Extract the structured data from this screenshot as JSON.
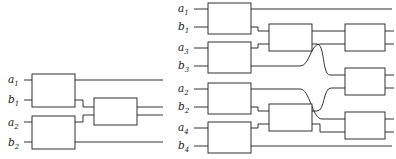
{
  "figure": {
    "title": "",
    "background_color": "#ffffff",
    "line_color": "#1b1b1b",
    "panels": [
      {
        "id": "left-network",
        "name": "left-circuit-diagram",
        "input_labels": [
          "a₁",
          "b₁",
          "a₂",
          "b₂"
        ],
        "label_parts": [
          {
            "base": "a",
            "sub": "1"
          },
          {
            "base": "b",
            "sub": "1"
          },
          {
            "base": "a",
            "sub": "2"
          },
          {
            "base": "b",
            "sub": "2"
          }
        ],
        "gate_count": 3,
        "gates": [
          {
            "name": "gate-l1",
            "column": 1,
            "wires": [
              "a1",
              "b1"
            ]
          },
          {
            "name": "gate-l2",
            "column": 1,
            "wires": [
              "a2",
              "b2"
            ]
          },
          {
            "name": "gate-l3",
            "column": 2,
            "wires": [
              "b1",
              "a2"
            ]
          }
        ]
      },
      {
        "id": "right-network",
        "name": "right-circuit-diagram",
        "input_labels": [
          "a₁",
          "b₁",
          "a₃",
          "b₃",
          "a₂",
          "b₂",
          "a₄",
          "b₄"
        ],
        "label_parts": [
          {
            "base": "a",
            "sub": "1"
          },
          {
            "base": "b",
            "sub": "1"
          },
          {
            "base": "a",
            "sub": "3"
          },
          {
            "base": "b",
            "sub": "3"
          },
          {
            "base": "a",
            "sub": "2"
          },
          {
            "base": "b",
            "sub": "2"
          },
          {
            "base": "a",
            "sub": "4"
          },
          {
            "base": "b",
            "sub": "4"
          }
        ],
        "gate_count": 9,
        "gates": [
          {
            "name": "gate-r1",
            "column": 1,
            "wires": [
              "a1",
              "b1"
            ]
          },
          {
            "name": "gate-r2",
            "column": 1,
            "wires": [
              "a3",
              "b3"
            ]
          },
          {
            "name": "gate-r3",
            "column": 1,
            "wires": [
              "a2",
              "b2"
            ]
          },
          {
            "name": "gate-r4",
            "column": 1,
            "wires": [
              "a4",
              "b4"
            ]
          },
          {
            "name": "gate-r5",
            "column": 2,
            "wires": [
              "b1",
              "a3"
            ]
          },
          {
            "name": "gate-r6",
            "column": 2,
            "wires": [
              "b2",
              "a4"
            ]
          },
          {
            "name": "gate-r7",
            "column": 3,
            "wires": [
              "top-pair"
            ]
          },
          {
            "name": "gate-r8",
            "column": 3,
            "wires": [
              "middle-pair"
            ]
          },
          {
            "name": "gate-r9",
            "column": 3,
            "wires": [
              "bottom-pair"
            ]
          }
        ],
        "crossings": 2
      }
    ]
  }
}
